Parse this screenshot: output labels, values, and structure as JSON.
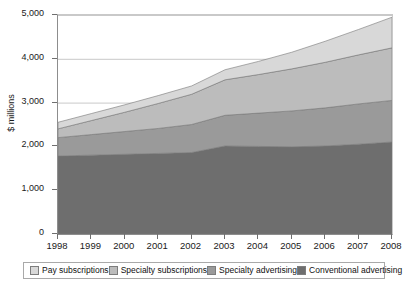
{
  "chart_data": {
    "type": "area",
    "stacked": true,
    "title": "",
    "xlabel": "",
    "ylabel": "$ millions",
    "categories": [
      "1998",
      "1999",
      "2000",
      "2001",
      "2002",
      "2003",
      "2004",
      "2005",
      "2006",
      "2007",
      "2008"
    ],
    "x": [
      1998,
      1999,
      2000,
      2001,
      2002,
      2003,
      2004,
      2005,
      2006,
      2007,
      2008
    ],
    "xlim": [
      1998,
      2008
    ],
    "ylim": [
      0,
      5000
    ],
    "yticks": [
      0,
      1000,
      2000,
      3000,
      4000,
      5000
    ],
    "ytick_labels": [
      "0",
      "1,000",
      "2,000",
      "3,000",
      "4,000",
      "5,000"
    ],
    "grid": "horizontal",
    "legend_position": "bottom",
    "series": [
      {
        "name": "Conventional advertising",
        "color": "#6e6e6e",
        "values": [
          1780,
          1800,
          1820,
          1840,
          1860,
          2010,
          2000,
          1990,
          2010,
          2050,
          2100
        ]
      },
      {
        "name": "Specialty advertising",
        "color": "#9a9a9a",
        "values": [
          420,
          470,
          520,
          570,
          640,
          700,
          760,
          820,
          870,
          920,
          950
        ]
      },
      {
        "name": "Specialty subscriptions",
        "color": "#bcbcbc",
        "values": [
          200,
          320,
          440,
          570,
          690,
          810,
          880,
          960,
          1040,
          1120,
          1200
        ]
      },
      {
        "name": "Pay subscriptions",
        "color": "#d8d8d8",
        "values": [
          150,
          160,
          170,
          180,
          190,
          230,
          300,
          380,
          480,
          580,
          700
        ]
      }
    ],
    "stack_totals": [
      2550,
      2750,
      2950,
      3160,
      3380,
      3750,
      3940,
      4150,
      4400,
      4670,
      4950
    ]
  },
  "legend": {
    "items": [
      {
        "label": "Pay subscriptions",
        "color": "#d8d8d8"
      },
      {
        "label": "Specialty subscriptions",
        "color": "#bcbcbc"
      },
      {
        "label": "Specialty advertising",
        "color": "#9a9a9a"
      },
      {
        "label": "Conventional advertising",
        "color": "#6e6e6e"
      }
    ]
  },
  "axes": {
    "y_title": "$ millions"
  },
  "colors": {
    "background": "#ffffff",
    "axis": "#6f6f6f",
    "gridline": "#c9c9c9",
    "text": "#1a1a1a"
  }
}
